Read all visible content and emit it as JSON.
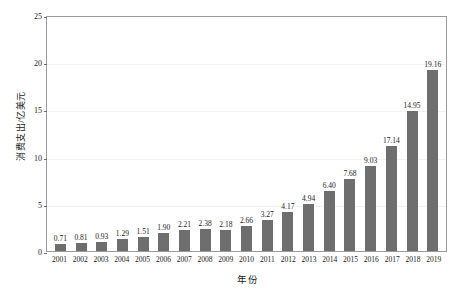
{
  "chart_data": {
    "type": "bar",
    "title": "",
    "subtitle": "",
    "xlabel": "年份",
    "ylabel": "消费支出/亿美元",
    "categories": [
      "2001",
      "2002",
      "2003",
      "2004",
      "2005",
      "2006",
      "2007",
      "2008",
      "2009",
      "2010",
      "2011",
      "2012",
      "2013",
      "2014",
      "2015",
      "2016",
      "2017",
      "2018",
      "2019"
    ],
    "values": [
      0.71,
      0.81,
      0.93,
      1.29,
      1.51,
      1.9,
      2.21,
      2.38,
      2.18,
      2.66,
      3.27,
      4.17,
      4.94,
      6.4,
      7.68,
      9.03,
      17.14,
      14.95,
      19.16
    ],
    "bar_heights_drawn": [
      0.71,
      0.81,
      0.93,
      1.29,
      1.51,
      1.9,
      2.21,
      2.38,
      2.18,
      2.66,
      3.27,
      4.17,
      4.94,
      6.4,
      7.68,
      9.03,
      11.1,
      14.8,
      19.16
    ],
    "data_labels": [
      "0.71",
      "0.81",
      "0.93",
      "1.29",
      "1.51",
      "1.90",
      "2.21",
      "2.38",
      "2.18",
      "2.66",
      "3.27",
      "4.17",
      "4.94",
      "6.40",
      "7.68",
      "9.03",
      "17.14",
      "14.95",
      "19.16"
    ],
    "ylim": [
      0,
      25
    ],
    "yticks": [
      0,
      5,
      10,
      15,
      20,
      25
    ],
    "ytick_labels": [
      "0",
      "5",
      "10",
      "15",
      "20",
      "25"
    ],
    "grid": true,
    "legend": "none",
    "bar_color": "#6e6e6e",
    "axis_color": "#9a9a9a",
    "grid_color": "#f2f2f2",
    "text_color": "#1a1a1a",
    "background": "#ffffff"
  }
}
